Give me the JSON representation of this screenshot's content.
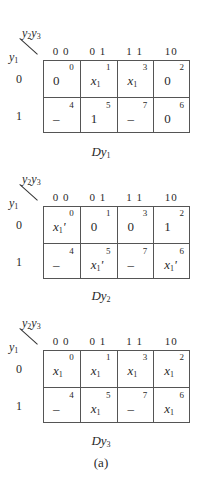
{
  "figure": {
    "caption": "(a)",
    "top_variables": "y2y3",
    "left_variable": "y1",
    "column_headers": [
      "0 0",
      "0 1",
      "1 1",
      "10"
    ],
    "row_headers": [
      "0",
      "1"
    ],
    "maps": [
      {
        "label": "Dy1",
        "cells": [
          [
            {
              "index": "0",
              "value": "0"
            },
            {
              "index": "1",
              "value": "x1"
            },
            {
              "index": "3",
              "value": "x1"
            },
            {
              "index": "2",
              "value": "0"
            }
          ],
          [
            {
              "index": "4",
              "value": "–"
            },
            {
              "index": "5",
              "value": "1"
            },
            {
              "index": "7",
              "value": "–"
            },
            {
              "index": "6",
              "value": "0"
            }
          ]
        ]
      },
      {
        "label": "Dy2",
        "cells": [
          [
            {
              "index": "0",
              "value": "x1'"
            },
            {
              "index": "1",
              "value": "0"
            },
            {
              "index": "3",
              "value": "0"
            },
            {
              "index": "2",
              "value": "1"
            }
          ],
          [
            {
              "index": "4",
              "value": "–"
            },
            {
              "index": "5",
              "value": "x1'"
            },
            {
              "index": "7",
              "value": "–"
            },
            {
              "index": "6",
              "value": "x1'"
            }
          ]
        ]
      },
      {
        "label": "Dy3",
        "cells": [
          [
            {
              "index": "0",
              "value": "x1"
            },
            {
              "index": "1",
              "value": "x1"
            },
            {
              "index": "3",
              "value": "x1"
            },
            {
              "index": "2",
              "value": "x1"
            }
          ],
          [
            {
              "index": "4",
              "value": "–"
            },
            {
              "index": "5",
              "value": "x1"
            },
            {
              "index": "7",
              "value": "–"
            },
            {
              "index": "6",
              "value": "x1"
            }
          ]
        ]
      }
    ]
  }
}
